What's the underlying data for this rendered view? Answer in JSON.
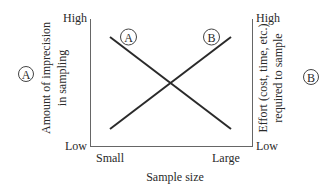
{
  "diagram": {
    "x_axis": {
      "label": "Sample size",
      "tick_left": "Small",
      "tick_right": "Large"
    },
    "left_axis": {
      "high": "High",
      "low": "Low",
      "label_line1": "Amount of imprecision",
      "label_line2": "in sampling",
      "badge": "A"
    },
    "right_axis": {
      "high": "High",
      "low": "Low",
      "label_line1": "Effort (cost, time, etc.)",
      "label_line2": "required to sample",
      "badge": "B"
    },
    "curves": [
      {
        "id": "A",
        "label": "A",
        "description": "Imprecision decreases as sample size increases",
        "from": [
          0,
          "High"
        ],
        "to": [
          1,
          "Low"
        ]
      },
      {
        "id": "B",
        "label": "B",
        "description": "Effort increases as sample size increases",
        "from": [
          0,
          "Low"
        ],
        "to": [
          1,
          "High"
        ]
      }
    ],
    "colors": {
      "line": "#2a2a2a",
      "axis": "#555555",
      "background": "#ffffff"
    }
  }
}
